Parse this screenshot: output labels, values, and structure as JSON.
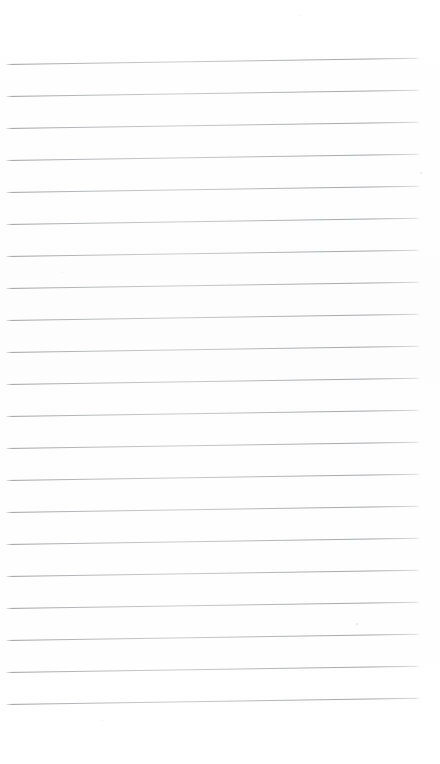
{
  "page": {
    "kind": "lined-paper-sheet",
    "width_px": 440,
    "height_px": 764,
    "background_color": "#ffffff",
    "paper_tone_color": "#fdfdfd",
    "has_text_content": false,
    "has_margin_rule": false,
    "orientation": "portrait"
  },
  "ruling": {
    "line_count": 21,
    "line_color": "#9aa0a6",
    "line_thickness_px": 1,
    "line_spacing_px": 32,
    "first_line_y_px": 64,
    "last_line_y_px": 704,
    "line_start_x_px": 6,
    "line_end_x_px": 420,
    "slant_degrees": -0.85,
    "slant_description": "lines rise slightly toward the right edge",
    "top_margin_px": 64,
    "bottom_margin_px": 60,
    "left_margin_px": 6,
    "right_margin_px": 20
  },
  "lines": [
    {
      "index": 1,
      "y": 64,
      "x_start": 6,
      "x_end": 420
    },
    {
      "index": 2,
      "y": 96,
      "x_start": 6,
      "x_end": 420
    },
    {
      "index": 3,
      "y": 128,
      "x_start": 6,
      "x_end": 420
    },
    {
      "index": 4,
      "y": 160,
      "x_start": 6,
      "x_end": 420
    },
    {
      "index": 5,
      "y": 192,
      "x_start": 6,
      "x_end": 420
    },
    {
      "index": 6,
      "y": 224,
      "x_start": 6,
      "x_end": 420
    },
    {
      "index": 7,
      "y": 256,
      "x_start": 6,
      "x_end": 420
    },
    {
      "index": 8,
      "y": 288,
      "x_start": 6,
      "x_end": 420
    },
    {
      "index": 9,
      "y": 320,
      "x_start": 6,
      "x_end": 420
    },
    {
      "index": 10,
      "y": 352,
      "x_start": 6,
      "x_end": 420
    },
    {
      "index": 11,
      "y": 384,
      "x_start": 6,
      "x_end": 420
    },
    {
      "index": 12,
      "y": 416,
      "x_start": 6,
      "x_end": 420
    },
    {
      "index": 13,
      "y": 448,
      "x_start": 6,
      "x_end": 420
    },
    {
      "index": 14,
      "y": 480,
      "x_start": 6,
      "x_end": 420
    },
    {
      "index": 15,
      "y": 512,
      "x_start": 6,
      "x_end": 420
    },
    {
      "index": 16,
      "y": 544,
      "x_start": 6,
      "x_end": 420
    },
    {
      "index": 17,
      "y": 576,
      "x_start": 6,
      "x_end": 420
    },
    {
      "index": 18,
      "y": 608,
      "x_start": 6,
      "x_end": 420
    },
    {
      "index": 19,
      "y": 640,
      "x_start": 6,
      "x_end": 420
    },
    {
      "index": 20,
      "y": 672,
      "x_start": 6,
      "x_end": 420
    },
    {
      "index": 21,
      "y": 704,
      "x_start": 6,
      "x_end": 420
    }
  ],
  "specks": [
    {
      "x": 420,
      "y": 172,
      "size": 2.0
    },
    {
      "x": 356,
      "y": 623,
      "size": 1.6
    },
    {
      "x": 102,
      "y": 720,
      "size": 1.4
    },
    {
      "x": 62,
      "y": 272,
      "size": 1.3
    },
    {
      "x": 300,
      "y": 15,
      "size": 1.2
    }
  ]
}
